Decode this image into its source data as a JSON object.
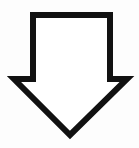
{
  "figure": {
    "shape": "down-arrow",
    "fill_color": "#ffffff",
    "stroke_color": "#111111",
    "background_color": "#fdfdfd"
  }
}
